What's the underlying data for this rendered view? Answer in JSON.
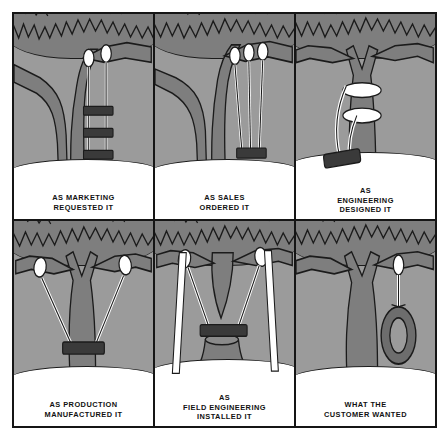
{
  "image": {
    "title": "Tree Swing Project Cartoon",
    "background_color": "#ffffff",
    "frame_border_color": "#151515",
    "sky_color": "#9b9b9b",
    "tree_color": "#7e7e7e",
    "ground_color": "#ffffff",
    "ink_color": "#1b1b1b",
    "plank_color": "#3a3a3a"
  },
  "panels": [
    {
      "id": "marketing",
      "row": "top",
      "column": 1,
      "caption": "AS MARKETING\nREQUESTED IT",
      "caption_line1": "AS MARKETING",
      "caption_line2": "REQUESTED IT",
      "scene_description": "Three stacked plank seats hung like a ladder from one branch on two ropes",
      "seat_count": 3,
      "rope_count": 2
    },
    {
      "id": "sales",
      "row": "top",
      "column": 2,
      "caption": "AS SALES\nORDERED IT",
      "caption_line1": "AS SALES",
      "caption_line2": "ORDERED IT",
      "scene_description": "One plank seat hung from a branch on three long ropes",
      "seat_count": 1,
      "rope_count": 3
    },
    {
      "id": "engineering",
      "row": "top",
      "column": 3,
      "caption": "AS\nENGINEERING\nDESIGNED IT",
      "caption_line1": "AS",
      "caption_line2": "ENGINEERING",
      "caption_line3": "DESIGNED IT",
      "scene_description": "Seat tied flat against the trunk with rope loops wrapped around the trunk",
      "seat_count": 1,
      "rope_count": 2
    },
    {
      "id": "production",
      "row": "bottom",
      "column": 1,
      "caption": "AS PRODUCTION\nMANUFACTURED IT",
      "caption_line1": "AS PRODUCTION",
      "caption_line2": "MANUFACTURED IT",
      "scene_description": "Seat slung across the trunk from two wide branches so the trunk blocks it",
      "seat_count": 1,
      "rope_count": 2
    },
    {
      "id": "field-engineering",
      "row": "bottom",
      "column": 2,
      "caption": "AS\nFIELD ENGINEERING\nINSTALLED IT",
      "caption_line1": "AS",
      "caption_line2": "FIELD ENGINEERING",
      "caption_line3": "INSTALLED IT",
      "scene_description": "Seat resting on a cut stump with extra support poles propped outward",
      "seat_count": 1,
      "rope_count": 2,
      "support_poles": 2
    },
    {
      "id": "customer",
      "row": "bottom",
      "column": 3,
      "caption": "WHAT THE\nCUSTOMER WANTED",
      "caption_line1": "WHAT THE",
      "caption_line2": "CUSTOMER WANTED",
      "scene_description": "A simple tire swing hanging from one branch on a single rope",
      "seat_count": 1,
      "rope_count": 1
    }
  ]
}
